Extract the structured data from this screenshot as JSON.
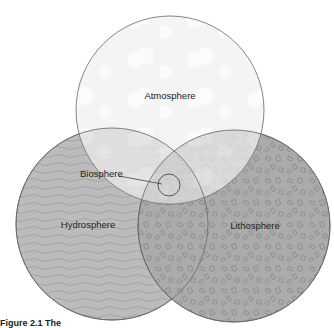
{
  "diagram": {
    "type": "venn",
    "circles": [
      {
        "id": "atmosphere",
        "label": "Atmosphere",
        "fill": "#f4f4f4",
        "pattern": "clouds"
      },
      {
        "id": "hydrosphere",
        "label": "Hydrosphere",
        "fill": "#b9b9b9",
        "pattern": "waves"
      },
      {
        "id": "lithosphere",
        "label": "Lithosphere",
        "fill": "#a9a9a9",
        "pattern": "rock-fragments"
      }
    ],
    "center": {
      "id": "biosphere",
      "label": "Biosphere"
    },
    "caption": "Figure 2.1  The"
  }
}
